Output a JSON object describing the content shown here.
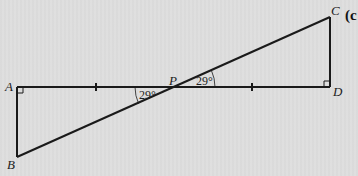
{
  "figure": {
    "part_label": "(c",
    "points": {
      "A": {
        "label": "A",
        "x": 17,
        "y": 87
      },
      "B": {
        "label": "B",
        "x": 17,
        "y": 157
      },
      "P": {
        "label": "P",
        "x": 175,
        "y": 87
      },
      "C": {
        "label": "C",
        "x": 330,
        "y": 17
      },
      "D": {
        "label": "D",
        "x": 330,
        "y": 87
      }
    },
    "angles": {
      "APB": "29°",
      "CPD": "29°"
    },
    "right_angles": [
      "A",
      "D"
    ],
    "equal_segments": [
      "AP",
      "PD"
    ],
    "colors": {
      "line": "#1a1a1a",
      "background": "#dcdcdc"
    }
  }
}
